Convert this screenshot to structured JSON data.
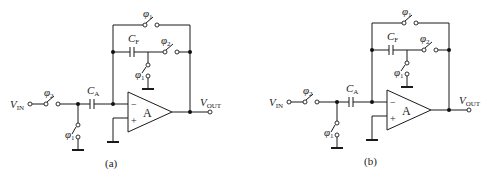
{
  "figure": {
    "panels": [
      {
        "id": "a",
        "caption": "(a)",
        "input": {
          "label": "V",
          "sub": "IN"
        },
        "output": {
          "label": "V",
          "sub": "OUT"
        },
        "input_switch": {
          "phase": "φ",
          "sub": "2"
        },
        "shunt_switch": {
          "phase": "φ",
          "sub": "1"
        },
        "sampling_cap": {
          "label": "C",
          "sub": "A"
        },
        "feedback_cap": {
          "label": "C",
          "sub": "F"
        },
        "reset_switch": {
          "phase": "φ",
          "sub": "1"
        },
        "feedback_series_switch": {
          "phase": "φ",
          "sub": "2"
        },
        "feedback_ground_switch": {
          "phase": "φ",
          "sub": "1"
        },
        "amp": {
          "label": "A",
          "minus": "−",
          "plus": "+"
        }
      },
      {
        "id": "b",
        "caption": "(b)",
        "input": {
          "label": "V",
          "sub": "IN"
        },
        "output": {
          "label": "V",
          "sub": "OUT"
        },
        "input_switch": {
          "phase": "φ",
          "sub": "2"
        },
        "shunt_switch": {
          "phase": "φ",
          "sub": "1"
        },
        "sampling_cap": {
          "label": "C",
          "sub": "A"
        },
        "feedback_cap": {
          "label": "C",
          "sub": "F"
        },
        "reset_switch": {
          "phase": "φ",
          "sub": "1"
        },
        "feedback_series_switch": {
          "phase": "φ",
          "sub": "2"
        },
        "feedback_ground_switch": {
          "phase": "φ",
          "sub": "1"
        },
        "amp": {
          "label": "A",
          "minus": "−",
          "plus": "+"
        }
      }
    ]
  }
}
